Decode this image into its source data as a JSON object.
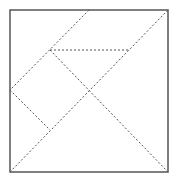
{
  "diagram": {
    "type": "tangram",
    "colors": {
      "background": "#ffffff",
      "outline": "#555555",
      "dashed": "#555555"
    },
    "square": {
      "x": 10,
      "y": 10,
      "width": 158,
      "height": 162
    },
    "dashed_lines": [
      {
        "name": "main-diagonal",
        "x1": 10,
        "y1": 172,
        "x2": 168,
        "y2": 10
      },
      {
        "name": "inner-diagonal",
        "x1": 50,
        "y1": 50,
        "x2": 168,
        "y2": 172
      },
      {
        "name": "top-left-cut",
        "x1": 89,
        "y1": 10,
        "x2": 10,
        "y2": 90
      },
      {
        "name": "horizontal-cut",
        "x1": 50,
        "y1": 50,
        "x2": 129,
        "y2": 50
      },
      {
        "name": "left-lower-cut",
        "x1": 10,
        "y1": 90,
        "x2": 50,
        "y2": 130
      }
    ]
  }
}
